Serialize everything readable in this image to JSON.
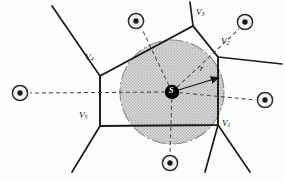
{
  "figure": {
    "name": "voronoi-cell-with-inscribed-circle",
    "background_color": "#fdfdfd",
    "line_color": "#1a1a1a",
    "circle_fill": "#d8d8d8",
    "circle_edge_color": "#8c8c8c",
    "site_marker_color": "#2b2b2b",
    "center_marker_color": "#000000",
    "dashed_color": "#4a4a4a"
  },
  "labels": {
    "v1": {
      "text": "V",
      "sub": "1",
      "x": 222,
      "y": 123
    },
    "v2": {
      "text": "V",
      "sub": "2",
      "x": 222,
      "y": 41
    },
    "v3": {
      "text": "V",
      "sub": "3",
      "x": 196,
      "y": 11
    },
    "v4": {
      "text": "V",
      "sub": "4",
      "x": 87,
      "y": 57
    },
    "v5": {
      "text": "V",
      "sub": "5",
      "x": 81,
      "y": 114
    },
    "radius": {
      "text": "r",
      "x": 202,
      "y": 68
    },
    "center": {
      "text": "S",
      "x": 172,
      "y": 92
    }
  },
  "geometry": {
    "circle": {
      "cx": 172,
      "cy": 92,
      "r": 52
    },
    "center_site": {
      "cx": 172,
      "cy": 92,
      "r": 7
    },
    "polygon_vertices": [
      {
        "name": "V1",
        "x": 218,
        "y": 125
      },
      {
        "name": "V2",
        "x": 218,
        "y": 57
      },
      {
        "name": "V3",
        "x": 193,
        "y": 26
      },
      {
        "name": "V4",
        "x": 100,
        "y": 76
      },
      {
        "name": "V5",
        "x": 100,
        "y": 126
      }
    ],
    "radius_arrow": {
      "x1": 172,
      "y1": 92,
      "x2": 221,
      "y2": 77
    },
    "neighbor_sites": [
      {
        "name": "site-left",
        "cx": 20,
        "cy": 93,
        "r": 8
      },
      {
        "name": "site-top-left",
        "cx": 136,
        "cy": 21,
        "r": 8
      },
      {
        "name": "site-top-right",
        "cx": 245,
        "cy": 22,
        "r": 8
      },
      {
        "name": "site-right",
        "cx": 265,
        "cy": 100,
        "r": 8
      },
      {
        "name": "site-bottom",
        "cx": 170,
        "cy": 163,
        "r": 8
      }
    ],
    "external_edges": [
      {
        "name": "edge-from-v3-up",
        "x1": 193,
        "y1": 26,
        "x2": 190,
        "y2": 2
      },
      {
        "name": "edge-from-v2-right",
        "x1": 218,
        "y1": 57,
        "x2": 282,
        "y2": 64
      },
      {
        "name": "edge-from-v1-downright",
        "x1": 218,
        "y1": 125,
        "x2": 250,
        "y2": 172
      },
      {
        "name": "edge-from-v1-down",
        "x1": 218,
        "y1": 125,
        "x2": 205,
        "y2": 172
      },
      {
        "name": "edge-from-v5-down",
        "x1": 100,
        "y1": 126,
        "x2": 72,
        "y2": 172
      },
      {
        "name": "edge-from-v4-upleft",
        "x1": 100,
        "y1": 76,
        "x2": 52,
        "y2": 6
      }
    ],
    "dashed_connectors": [
      {
        "name": "dash-to-site-left",
        "x1": 172,
        "y1": 92,
        "x2": 30,
        "y2": 93
      },
      {
        "name": "dash-to-site-top-left",
        "x1": 172,
        "y1": 92,
        "x2": 142,
        "y2": 29
      },
      {
        "name": "dash-to-site-top-right",
        "x1": 172,
        "y1": 92,
        "x2": 239,
        "y2": 29
      },
      {
        "name": "dash-to-site-right",
        "x1": 172,
        "y1": 92,
        "x2": 256,
        "y2": 100
      },
      {
        "name": "dash-to-site-bottom",
        "x1": 172,
        "y1": 92,
        "x2": 170,
        "y2": 154
      }
    ]
  }
}
